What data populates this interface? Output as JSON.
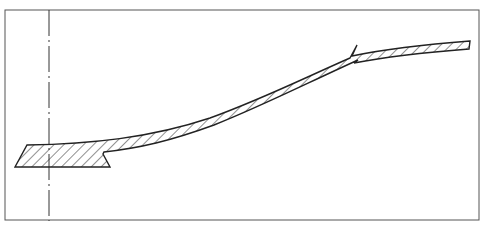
{
  "diagram": {
    "type": "cross-section drawing",
    "colors": {
      "background": "#ffffff",
      "stroke": "#222222",
      "frame": "#555555"
    },
    "frame": {
      "x": 5,
      "y": 10,
      "width": 474,
      "height": 210
    },
    "center_line": {
      "x": 49,
      "y1": 10,
      "y2": 220,
      "style": "dash-dot"
    },
    "labels": []
  }
}
